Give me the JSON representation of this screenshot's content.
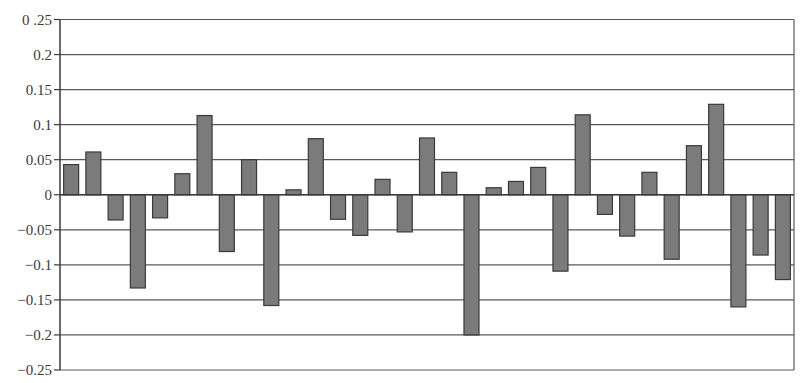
{
  "chart_data": {
    "type": "bar",
    "title": "",
    "xlabel": "",
    "ylabel": "",
    "ylim": [
      -0.25,
      0.25
    ],
    "grid": true,
    "legend": null,
    "y_ticks": [
      0.25,
      0.2,
      0.15,
      0.1,
      0.05,
      0,
      -0.05,
      -0.1,
      -0.15,
      -0.2,
      -0.25
    ],
    "y_tick_labels": [
      "0 .25",
      "0.2",
      "0.15",
      "0.1",
      "0.05",
      "0",
      "−0.05",
      "−0.1",
      "−0.15",
      "−0.2",
      "−0.25"
    ],
    "categories": [
      "1",
      "2",
      "3",
      "4",
      "5",
      "6",
      "7",
      "8",
      "9",
      "10",
      "11",
      "12",
      "13",
      "14",
      "15",
      "16",
      "17",
      "18",
      "19",
      "20",
      "21",
      "22",
      "23",
      "24",
      "25",
      "26",
      "27",
      "28",
      "29",
      "30",
      "31",
      "32",
      "33"
    ],
    "values": [
      0.043,
      0.061,
      -0.036,
      -0.133,
      -0.033,
      0.03,
      0.113,
      -0.081,
      0.05,
      -0.158,
      0.007,
      0.08,
      -0.035,
      -0.058,
      0.022,
      -0.053,
      0.081,
      0.032,
      -0.2,
      0.01,
      0.019,
      0.039,
      -0.109,
      0.114,
      -0.028,
      -0.059,
      0.032,
      -0.092,
      0.07,
      0.129,
      -0.16,
      -0.086,
      -0.121
    ]
  },
  "style": {
    "bar_fill": "#7b7b7b",
    "bar_stroke": "#3a3a3a",
    "grid_color": "#5a5a5a",
    "axis_color": "#3a3a3a",
    "background": "#ffffff"
  },
  "layout": {
    "plot_left": 60,
    "plot_right": 794,
    "plot_top": 19.5,
    "plot_bottom": 370,
    "bar_width": 15,
    "tick_length": 6
  }
}
